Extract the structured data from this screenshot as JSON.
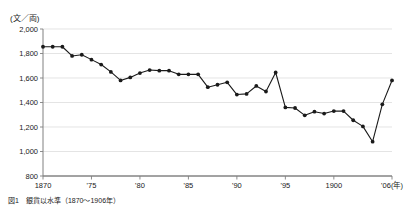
{
  "figure": {
    "unit_label": "(文／両)",
    "caption": "図1　銀貨以水準（1870〜1906年）"
  },
  "chart_data": {
    "type": "line",
    "title": "",
    "subtitle": "",
    "xlabel": "(年)",
    "ylabel": "(文／両)",
    "ylim": [
      800,
      2000
    ],
    "xlim": [
      1870,
      1906
    ],
    "grid": true,
    "legend": null,
    "marker": "filled-circle",
    "line_color": "#1a1a1a",
    "marker_color": "#1a1a1a",
    "grid_color": "#d9d9d9",
    "axis_color": "#808080",
    "ytick_values": [
      800,
      1000,
      1200,
      1400,
      1600,
      1800,
      2000
    ],
    "ytick_labels": [
      "800",
      "1,000",
      "1,200",
      "1,400",
      "1,600",
      "1,800",
      "2,000"
    ],
    "xtick_values": [
      1870,
      1875,
      1880,
      1885,
      1890,
      1895,
      1900,
      1906
    ],
    "xtick_labels": [
      "1870",
      "'75",
      "'80",
      "'85",
      "'90",
      "'95",
      "1900",
      "'06(年)"
    ],
    "x": [
      1870,
      1871,
      1872,
      1873,
      1874,
      1875,
      1876,
      1877,
      1878,
      1879,
      1880,
      1881,
      1882,
      1883,
      1884,
      1885,
      1886,
      1887,
      1888,
      1889,
      1890,
      1891,
      1892,
      1893,
      1894,
      1895,
      1896,
      1897,
      1898,
      1899,
      1900,
      1901,
      1902,
      1903,
      1904,
      1905,
      1906
    ],
    "values": [
      1855,
      1855,
      1855,
      1780,
      1790,
      1750,
      1710,
      1650,
      1580,
      1605,
      1640,
      1665,
      1660,
      1660,
      1630,
      1630,
      1630,
      1525,
      1545,
      1565,
      1465,
      1470,
      1535,
      1490,
      1645,
      1360,
      1355,
      1295,
      1325,
      1310,
      1330,
      1330,
      1255,
      1205,
      1080,
      1385,
      1580
    ]
  }
}
